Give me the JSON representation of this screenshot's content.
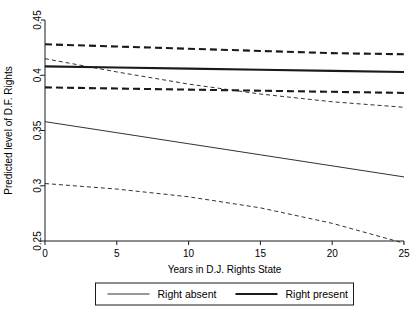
{
  "chart_data": {
    "type": "line",
    "title": "",
    "xlabel": "Years in D.J. Rights State",
    "ylabel": "Predicted level of D.F. Rights",
    "xlim": [
      0,
      25
    ],
    "ylim": [
      0.25,
      0.45
    ],
    "xticks": [
      0,
      5,
      10,
      15,
      20,
      25
    ],
    "xtick_labels": [
      "0",
      "5",
      "10",
      "15",
      "20",
      "25"
    ],
    "yticks": [
      0.25,
      0.3,
      0.35,
      0.4,
      0.45
    ],
    "ytick_labels": [
      "0.25",
      "0.3",
      "0.35",
      "0.4",
      "0.45"
    ],
    "grid": false,
    "legend_position": "bottom",
    "x": [
      0,
      5,
      10,
      15,
      20,
      25
    ],
    "series": [
      {
        "name": "Right absent",
        "style": "solid",
        "width": "thin",
        "role": "fit",
        "values": [
          0.358,
          0.348,
          0.338,
          0.328,
          0.318,
          0.308
        ]
      },
      {
        "name": "Right absent upper CI",
        "style": "dashed",
        "width": "thin",
        "role": "confidence-upper",
        "values": [
          0.415,
          0.403,
          0.392,
          0.383,
          0.376,
          0.371
        ]
      },
      {
        "name": "Right absent lower CI",
        "style": "dashed",
        "width": "thin",
        "role": "confidence-lower",
        "values": [
          0.302,
          0.297,
          0.29,
          0.28,
          0.266,
          0.248
        ]
      },
      {
        "name": "Right present",
        "style": "solid",
        "width": "thick",
        "role": "fit",
        "values": [
          0.408,
          0.407,
          0.406,
          0.405,
          0.404,
          0.403
        ]
      },
      {
        "name": "Right present upper CI",
        "style": "dashed",
        "width": "thick",
        "role": "confidence-upper",
        "values": [
          0.428,
          0.426,
          0.424,
          0.422,
          0.42,
          0.419
        ]
      },
      {
        "name": "Right present lower CI",
        "style": "dashed",
        "width": "thick",
        "role": "confidence-lower",
        "values": [
          0.389,
          0.388,
          0.387,
          0.386,
          0.385,
          0.384
        ]
      }
    ],
    "legend": [
      {
        "label": "Right absent",
        "style": "solid",
        "width": "thin"
      },
      {
        "label": "Right present",
        "style": "solid",
        "width": "thick"
      }
    ]
  }
}
